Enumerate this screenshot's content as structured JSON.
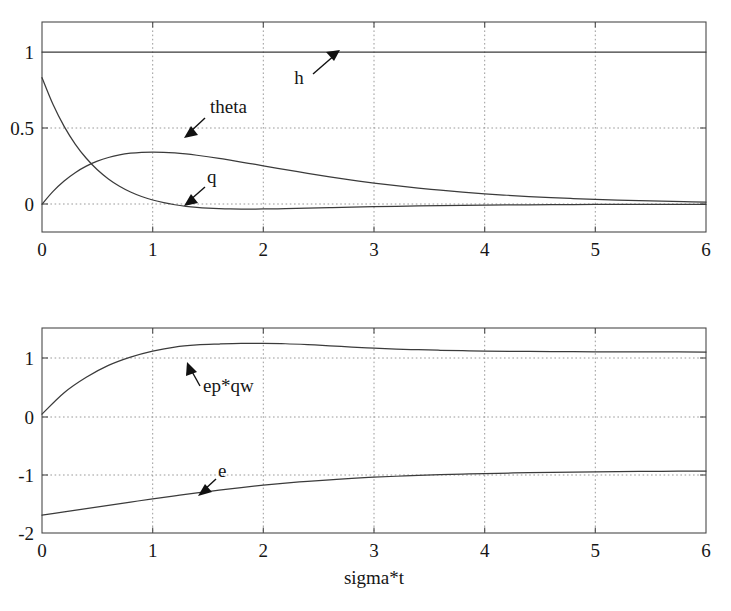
{
  "figure": {
    "background": "#ffffff",
    "curve_color": "#3b3b3b",
    "grid_color": "#9a9a9a",
    "frame_color": "#4a4a4a",
    "xlabel": "sigma*t"
  },
  "chart_data": [
    {
      "type": "line",
      "panel": "top",
      "title": "",
      "xlabel": "",
      "ylabel": "",
      "xlim": [
        0,
        6
      ],
      "ylim": [
        -0.22,
        1.44
      ],
      "grid": true,
      "legend": "inline-annotations",
      "xticks": [
        0,
        1,
        2,
        3,
        4,
        5,
        6
      ],
      "xticklabels": [
        "0",
        "1",
        "2",
        "3",
        "4",
        "5",
        "6"
      ],
      "yticks": [
        0,
        0.5,
        1
      ],
      "yticklabels": [
        "0",
        "0.5",
        "1"
      ],
      "x": [
        0,
        0.1,
        0.2,
        0.3,
        0.4,
        0.5,
        0.6,
        0.7,
        0.8,
        0.9,
        1.0,
        1.1,
        1.2,
        1.3,
        1.4,
        1.5,
        1.6,
        1.7,
        1.8,
        1.9,
        2.0,
        2.2,
        2.4,
        2.6,
        2.8,
        3.0,
        3.2,
        3.4,
        3.6,
        3.8,
        4.0,
        4.2,
        4.4,
        4.6,
        4.8,
        5.0,
        5.2,
        5.4,
        5.6,
        5.8,
        6.0
      ],
      "series": [
        {
          "name": "h",
          "annotation": "h",
          "values": [
            1,
            1,
            1,
            1,
            1,
            1,
            1,
            1,
            1,
            1,
            1,
            1,
            1,
            1,
            1,
            1,
            1,
            1,
            1,
            1,
            1,
            1,
            1,
            1,
            1,
            1,
            1,
            1,
            1,
            1,
            1,
            1,
            1,
            1,
            1,
            1,
            1,
            1,
            1,
            1,
            1
          ]
        },
        {
          "name": "theta",
          "annotation": "theta",
          "values": [
            1.0,
            0.905,
            0.819,
            0.741,
            0.67,
            0.607,
            0.549,
            0.497,
            0.449,
            0.407,
            0.368,
            0.333,
            0.301,
            0.273,
            0.247,
            0.223,
            0.202,
            0.183,
            0.165,
            0.15,
            0.135,
            0.111,
            0.091,
            0.074,
            0.061,
            0.05,
            0.041,
            0.033,
            0.027,
            0.022,
            0.018,
            0.015,
            0.012,
            0.01,
            0.008,
            0.007,
            0.006,
            0.005,
            0.004,
            0.003,
            0.002
          ]
        },
        {
          "name": "q",
          "annotation": "q",
          "values": [
            0.0,
            0.09,
            0.164,
            0.222,
            0.268,
            0.303,
            0.329,
            0.348,
            0.359,
            0.366,
            0.368,
            0.366,
            0.361,
            0.354,
            0.345,
            0.335,
            0.323,
            0.311,
            0.298,
            0.285,
            0.271,
            0.244,
            0.218,
            0.193,
            0.17,
            0.149,
            0.13,
            0.113,
            0.098,
            0.085,
            0.073,
            0.063,
            0.054,
            0.046,
            0.039,
            0.034,
            0.029,
            0.024,
            0.021,
            0.018,
            0.015
          ]
        }
      ],
      "note": "q rendered as the hump peaking near x=1; theta rendered as the decaying curve that dips below zero to about -0.11 near x=2 before returning to 0"
    },
    {
      "type": "line",
      "panel": "bottom",
      "title": "",
      "xlabel": "sigma*t",
      "ylabel": "",
      "xlim": [
        0,
        6
      ],
      "ylim": [
        -2,
        1.45
      ],
      "grid": true,
      "legend": "inline-annotations",
      "xticks": [
        0,
        1,
        2,
        3,
        4,
        5,
        6
      ],
      "xticklabels": [
        "0",
        "1",
        "2",
        "3",
        "4",
        "5",
        "6"
      ],
      "yticks": [
        -2,
        -1,
        0,
        1
      ],
      "yticklabels": [
        "-2",
        "-1",
        "0",
        "1"
      ],
      "x": [
        0,
        0.2,
        0.4,
        0.6,
        0.8,
        1.0,
        1.2,
        1.4,
        1.6,
        1.8,
        2.0,
        2.2,
        2.4,
        2.6,
        2.8,
        3.0,
        3.2,
        3.4,
        3.6,
        3.8,
        4.0,
        4.4,
        4.8,
        5.2,
        5.6,
        6.0
      ],
      "series": [
        {
          "name": "ep*qw",
          "annotation": "ep*qw",
          "values": [
            0.0,
            0.36,
            0.62,
            0.82,
            0.96,
            1.06,
            1.13,
            1.165,
            1.18,
            1.19,
            1.19,
            1.185,
            1.17,
            1.15,
            1.13,
            1.11,
            1.095,
            1.085,
            1.075,
            1.068,
            1.062,
            1.055,
            1.051,
            1.049,
            1.047,
            1.046
          ]
        },
        {
          "name": "e",
          "annotation": "e",
          "values": [
            -1.7,
            -1.645,
            -1.59,
            -1.535,
            -1.48,
            -1.425,
            -1.375,
            -1.325,
            -1.28,
            -1.235,
            -1.195,
            -1.16,
            -1.13,
            -1.105,
            -1.08,
            -1.06,
            -1.045,
            -1.03,
            -1.018,
            -1.008,
            -1.0,
            -0.985,
            -0.975,
            -0.968,
            -0.962,
            -0.958
          ]
        }
      ]
    }
  ],
  "top_panel": {
    "yticklabels": [
      "1",
      "0.5",
      "0"
    ],
    "xticklabels": [
      "0",
      "1",
      "2",
      "3",
      "4",
      "5",
      "6"
    ],
    "annotations": [
      {
        "text": "h"
      },
      {
        "text": "theta"
      },
      {
        "text": "q"
      }
    ]
  },
  "bottom_panel": {
    "yticklabels": [
      "1",
      "0",
      "-1",
      "-2"
    ],
    "xticklabels": [
      "0",
      "1",
      "2",
      "3",
      "4",
      "5",
      "6"
    ],
    "annotations": [
      {
        "text": "ep*qw"
      },
      {
        "text": "e"
      }
    ],
    "xlabel": "sigma*t"
  }
}
